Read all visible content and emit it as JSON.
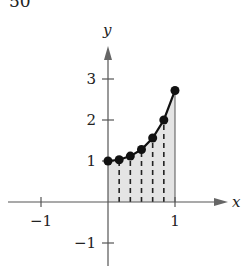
{
  "problem_number": "50",
  "chart_data": {
    "type": "line",
    "title": "",
    "xlabel": "x",
    "ylabel": "y",
    "xlim": [
      -1.5,
      1.8
    ],
    "ylim": [
      -1.5,
      3.7
    ],
    "x_ticks": [
      -1,
      1
    ],
    "x_tick_labels": [
      "−1",
      "1"
    ],
    "y_ticks": [
      -1,
      1,
      2,
      3
    ],
    "y_tick_labels": [
      "−1",
      "1",
      "2",
      "3"
    ],
    "grid": false,
    "legend": null,
    "series": [
      {
        "name": "y = e^(x^2)",
        "x": [
          0,
          0.1667,
          0.3333,
          0.5,
          0.6667,
          0.8333,
          1.0
        ],
        "values": [
          1.0,
          1.03,
          1.12,
          1.28,
          1.56,
          2.0,
          2.72
        ],
        "markers": true
      }
    ],
    "shaded_region": {
      "x_from": 0,
      "x_to": 1,
      "under": "y = e^(x^2)",
      "color": "#e4e4e4"
    },
    "dashed_partition_lines": [
      0.1667,
      0.3333,
      0.5,
      0.6667,
      0.8333
    ]
  }
}
